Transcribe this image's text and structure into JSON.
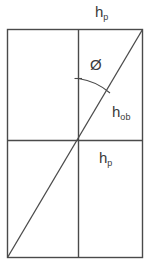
{
  "figure": {
    "background_color": "#ffffff",
    "line_color": "#4a4a4a",
    "text_color": "#3a3a3a",
    "width": 149,
    "height": 263
  },
  "labels": {
    "hp_top": {
      "base": "h",
      "sub": "p",
      "full": "h_p"
    },
    "hob": {
      "base": "h",
      "sub": "ob",
      "full": "h_ob"
    },
    "hp_bottom": {
      "base": "h",
      "sub": "p",
      "full": "h_p"
    },
    "angle": {
      "symbol": "Ø",
      "name": "phi"
    }
  },
  "geometry": {
    "rectangle": {
      "x": 7,
      "y": 29,
      "width": 136,
      "height": 229
    },
    "vertical_divider_x": 78,
    "horizontal_divider_y": 140,
    "diagonal": {
      "x1": 7,
      "y1": 258,
      "x2": 143,
      "y2": 29
    },
    "angle_arc": {
      "vertex_x": 78,
      "vertex_y": 140,
      "radius": 62,
      "tick_start": {
        "x": 78,
        "y": 78
      },
      "arc_end": {
        "x": 110,
        "y": 93
      }
    }
  }
}
